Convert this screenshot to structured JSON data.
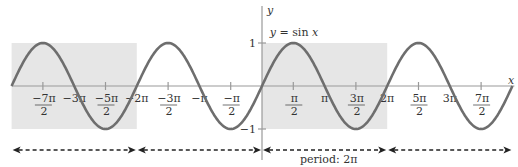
{
  "diagram": {
    "function_label": "y = sin x",
    "x_axis_label": "x",
    "y_axis_label": "y",
    "y_ticks": [
      {
        "value": 1,
        "label": "1"
      },
      {
        "value": -1,
        "label": "−1"
      }
    ],
    "x_ticks": [
      {
        "value_pi": -3.5,
        "num": "−7π",
        "den": "2"
      },
      {
        "value_pi": -3.0,
        "text": "−3π"
      },
      {
        "value_pi": -2.5,
        "num": "−5π",
        "den": "2"
      },
      {
        "value_pi": -2.0,
        "text": "−2π"
      },
      {
        "value_pi": -1.5,
        "num": "−3π",
        "den": "2"
      },
      {
        "value_pi": -1.0,
        "text": "−π"
      },
      {
        "value_pi": -0.5,
        "num": "−π",
        "den": "2"
      },
      {
        "value_pi": 0.5,
        "num": "π",
        "den": "2"
      },
      {
        "value_pi": 1.0,
        "text": "π"
      },
      {
        "value_pi": 1.5,
        "num": "3π",
        "den": "2"
      },
      {
        "value_pi": 2.0,
        "text": "2π"
      },
      {
        "value_pi": 2.5,
        "num": "5π",
        "den": "2"
      },
      {
        "value_pi": 3.0,
        "text": "3π"
      },
      {
        "value_pi": 3.5,
        "num": "7π",
        "den": "2"
      }
    ],
    "x_range_pi": [
      -4,
      4
    ],
    "y_range": [
      -1,
      1
    ],
    "shaded_periods_pi": [
      [
        -4,
        -2
      ],
      [
        0,
        2
      ]
    ],
    "period_arrows_pi": [
      [
        -4,
        -2
      ],
      [
        -2,
        0
      ],
      [
        0,
        2
      ],
      [
        2,
        4
      ]
    ],
    "period_label": "period: 2π",
    "colors": {
      "curve": "#6e6e6e",
      "shade": "#e6e6e6",
      "axis": "#999999",
      "arrow": "#222222",
      "text": "#333333"
    }
  }
}
